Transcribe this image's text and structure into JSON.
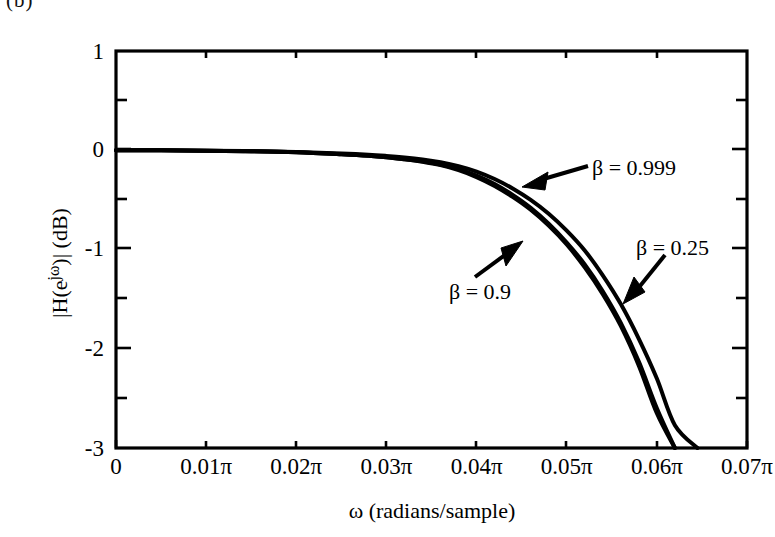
{
  "figure": {
    "panel_mark": "(b)"
  },
  "axes": {
    "x": {
      "title": "ω  (radians/sample)",
      "tick_labels": [
        "0",
        "0.01π",
        "0.02π",
        "0.03π",
        "0.04π",
        "0.05π",
        "0.06π",
        "0.07π"
      ],
      "min": 0,
      "max": 0.07
    },
    "y": {
      "title_prefix": "|H(e",
      "title_sup": "jω",
      "title_suffix": ")|  (dB)",
      "title_plain": "|H(e^{jω})|  (dB)",
      "tick_labels": [
        "1",
        "0",
        "-1",
        "-2",
        "-3"
      ],
      "min": -3,
      "max": 1
    }
  },
  "annotations": [
    {
      "id": "beta-0999",
      "text": "β = 0.999"
    },
    {
      "id": "beta-09",
      "text": "β = 0.9"
    },
    {
      "id": "beta-025",
      "text": "β = 0.25"
    }
  ],
  "chart_data": {
    "type": "line",
    "title": "",
    "xlabel": "ω  (radians/sample)",
    "ylabel": "|H(e^{jω})|  (dB)",
    "xlim": [
      0,
      0.07
    ],
    "ylim": [
      -3,
      1
    ],
    "x_unit": "π radians/sample",
    "xticks": [
      0,
      0.01,
      0.02,
      0.03,
      0.04,
      0.05,
      0.06,
      0.07
    ],
    "xticklabels": [
      "0",
      "0.01π",
      "0.02π",
      "0.03π",
      "0.04π",
      "0.05π",
      "0.06π",
      "0.07π"
    ],
    "yticks": [
      1,
      0,
      -1,
      -2,
      -3
    ],
    "yticklabels": [
      "1",
      "0",
      "-1",
      "-2",
      "-3"
    ],
    "y_minor_ticks": [
      0.5,
      -0.5,
      -1.5,
      -2.5
    ],
    "grid": false,
    "legend": "inline-annotations",
    "line_color": "#000000",
    "x": [
      0,
      0.005,
      0.01,
      0.015,
      0.02,
      0.025,
      0.028,
      0.03,
      0.032,
      0.034,
      0.036,
      0.038,
      0.04,
      0.042,
      0.044,
      0.046,
      0.048,
      0.05,
      0.052,
      0.054,
      0.056,
      0.058,
      0.06,
      0.062,
      0.0645
    ],
    "series": [
      {
        "name": "β = 0.25",
        "label": "β = 0.25",
        "values": [
          0,
          0,
          -0.005,
          -0.01,
          -0.02,
          -0.04,
          -0.055,
          -0.07,
          -0.09,
          -0.115,
          -0.15,
          -0.2,
          -0.27,
          -0.36,
          -0.47,
          -0.6,
          -0.76,
          -0.95,
          -1.18,
          -1.45,
          -1.77,
          -2.17,
          -2.65,
          -3,
          -3
        ]
      },
      {
        "name": "β = 0.9",
        "label": "β = 0.9",
        "values": [
          0,
          0,
          -0.005,
          -0.01,
          -0.02,
          -0.04,
          -0.055,
          -0.07,
          -0.09,
          -0.112,
          -0.145,
          -0.19,
          -0.255,
          -0.34,
          -0.45,
          -0.58,
          -0.74,
          -0.93,
          -1.15,
          -1.42,
          -1.74,
          -2.13,
          -2.6,
          -3,
          -3
        ]
      },
      {
        "name": "β = 0.999",
        "label": "β = 0.999",
        "values": [
          0,
          0,
          -0.004,
          -0.009,
          -0.018,
          -0.033,
          -0.045,
          -0.057,
          -0.072,
          -0.092,
          -0.12,
          -0.16,
          -0.215,
          -0.29,
          -0.385,
          -0.5,
          -0.64,
          -0.81,
          -1.01,
          -1.26,
          -1.55,
          -1.9,
          -2.3,
          -2.77,
          -3
        ]
      }
    ]
  }
}
